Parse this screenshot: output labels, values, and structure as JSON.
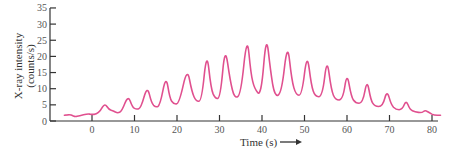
{
  "chart_data": {
    "type": "line",
    "title": "",
    "xlabel": "Time (s)",
    "ylabel": "X-ray intensity",
    "ylabel_unit": "(counts/s)",
    "xlim": [
      -8,
      82
    ],
    "ylim": [
      0,
      35
    ],
    "x_ticks": [
      0,
      10,
      20,
      30,
      40,
      50,
      60,
      70,
      80
    ],
    "y_ticks": [
      0,
      5,
      10,
      15,
      20,
      25,
      30,
      35
    ],
    "grid": false,
    "legend": null,
    "line_color": "#e0508f",
    "series": [
      {
        "name": "X-ray intensity",
        "x": [
          -6.5,
          -5,
          -4,
          -3,
          -1,
          0,
          1,
          2,
          3,
          4,
          5,
          6,
          7,
          8.5,
          9.5,
          10.5,
          11.5,
          13,
          14,
          15,
          16,
          17.4,
          18.3,
          19.2,
          20.5,
          22.4,
          23.5,
          24.5,
          25.8,
          27,
          28,
          29,
          30.2,
          31.3,
          32.5,
          33.5,
          35,
          36.5,
          37.4,
          38.2,
          39.8,
          41,
          42,
          43,
          44.6,
          46,
          47,
          48,
          49.4,
          50.6,
          51.6,
          52.5,
          54.2,
          55.3,
          56.3,
          57.3,
          59,
          60,
          61,
          62,
          63.7,
          64.7,
          65.6,
          66.5,
          68.4,
          69.4,
          70.4,
          71.5,
          73,
          73.9,
          74.8,
          76,
          77.6,
          78.4,
          79.4,
          80.5,
          82
        ],
        "values": [
          1.8,
          2.0,
          1.3,
          1.6,
          2.3,
          2.0,
          2.1,
          3.2,
          5.5,
          3.5,
          3.2,
          2.4,
          3.0,
          8.0,
          4.2,
          3.6,
          4.0,
          11.0,
          5.5,
          4.2,
          4.8,
          14.3,
          7.0,
          5.2,
          5.4,
          16.7,
          9.0,
          6.0,
          6.2,
          22.0,
          10.0,
          6.8,
          7.2,
          23.5,
          12.5,
          7.0,
          8.0,
          27.0,
          14.5,
          10.0,
          7.5,
          27.3,
          15.5,
          7.5,
          8.5,
          24.8,
          12.5,
          8.0,
          8.0,
          21.4,
          11.0,
          7.5,
          7.5,
          19.8,
          9.5,
          6.5,
          6.5,
          15.2,
          7.5,
          5.5,
          5.5,
          13.0,
          6.5,
          4.5,
          4.5,
          9.6,
          5.0,
          3.5,
          3.5,
          6.5,
          3.5,
          2.8,
          2.5,
          3.4,
          2.5,
          1.8,
          1.8
        ]
      }
    ]
  }
}
